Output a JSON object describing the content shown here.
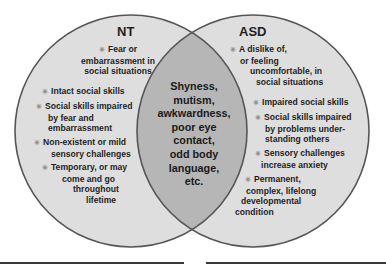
{
  "diagram": {
    "type": "venn",
    "colors": {
      "circle_fill": "#dcdcdc",
      "overlap_fill": "#b4b4b4",
      "outline": "#555555",
      "text": "#1e1e1e"
    },
    "left": {
      "title": "NT",
      "items": [
        {
          "lines": [
            "Fear or",
            "embarrassment in",
            "social situations"
          ]
        },
        {
          "lines": [
            "Intact social skills"
          ]
        },
        {
          "lines": [
            "Social skills impaired",
            "by fear and",
            "embarrassment"
          ]
        },
        {
          "lines": [
            "Non-existent or mild",
            "sensory challenges"
          ]
        },
        {
          "lines": [
            "Temporary, or may",
            "come and go",
            "throughout",
            "lifetime"
          ]
        }
      ]
    },
    "right": {
      "title": "ASD",
      "items": [
        {
          "lines": [
            "A dislike of,",
            "or feeling",
            "uncomfortable, in",
            "social situations"
          ]
        },
        {
          "lines": [
            "Impaired social skills"
          ]
        },
        {
          "lines": [
            "Social skills impaired",
            "by problems under-",
            "standing others"
          ]
        },
        {
          "lines": [
            "Sensory challenges",
            "increase anxiety"
          ]
        },
        {
          "lines": [
            "Permanent,",
            "complex, lifelong",
            "developmental",
            "condition"
          ]
        }
      ]
    },
    "overlap": {
      "lines": [
        "Shyness,",
        "mutism,",
        "awkwardness,",
        "poor eye",
        "contact,",
        "odd body",
        "language,",
        "etc."
      ]
    },
    "bullet_glyph": "✳"
  }
}
